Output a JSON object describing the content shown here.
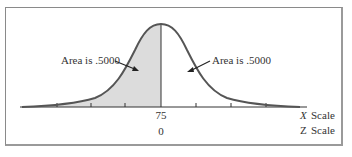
{
  "diagram": {
    "left_annotation": "Area is .5000",
    "right_annotation": "Area is .5000",
    "x_center_label": "75",
    "z_center_label": "0",
    "x_scale_label_var": "X",
    "x_scale_label_text": "Scale",
    "z_scale_label_var": "Z",
    "z_scale_label_text": "Scale",
    "colors": {
      "curve": "#555555",
      "shade": "#dcdcdc",
      "axis": "#333333",
      "frame": "#8a8a8a"
    }
  }
}
